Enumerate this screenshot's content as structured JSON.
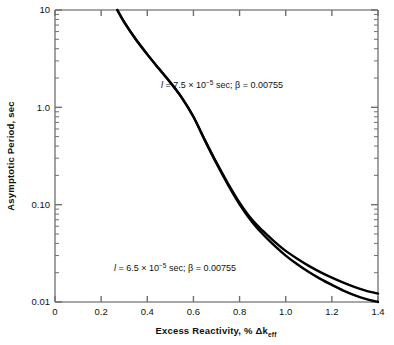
{
  "chart_data": {
    "type": "line",
    "title": "",
    "xlabel": "Excess Reactivity, % Δkeff",
    "ylabel": "Asymptotic Period, sec",
    "xscale": "linear",
    "yscale": "log",
    "xlim": [
      0,
      1.4
    ],
    "ylim": [
      0.01,
      10
    ],
    "grid": false,
    "legend_position": "inline-annotations",
    "xticks": [
      "0",
      "0.2",
      "0.4",
      "0.6",
      "0.8",
      "1.0",
      "1.2",
      "1.4"
    ],
    "xtick_values": [
      0,
      0.2,
      0.4,
      0.6,
      0.8,
      1.0,
      1.2,
      1.4
    ],
    "yticks": [
      "0.01",
      "0.10",
      "1.0",
      "10"
    ],
    "ytick_values": [
      0.01,
      0.1,
      1.0,
      10
    ],
    "series": [
      {
        "name": "l = 7.5 × 10⁻⁵ sec; β = 0.00755",
        "annotation": "l = 7.5 × 10⁻⁵ sec; β = 0.00755",
        "x": [
          0.27,
          0.3,
          0.35,
          0.4,
          0.45,
          0.5,
          0.55,
          0.6,
          0.65,
          0.7,
          0.75,
          0.8,
          0.85,
          0.9,
          0.95,
          1.0,
          1.05,
          1.1,
          1.15,
          1.2,
          1.25,
          1.3,
          1.35,
          1.4
        ],
        "y": [
          10.0,
          7.5,
          5.0,
          3.5,
          2.5,
          1.8,
          1.25,
          0.8,
          0.46,
          0.27,
          0.165,
          0.105,
          0.072,
          0.054,
          0.042,
          0.0335,
          0.0278,
          0.0235,
          0.0203,
          0.0178,
          0.0158,
          0.0142,
          0.013,
          0.0122
        ]
      },
      {
        "name": "l = 6.5 × 10⁻⁵ sec; β = 0.00755",
        "annotation": "l = 6.5 × 10⁻⁵ sec; β = 0.00755",
        "x": [
          0.27,
          0.3,
          0.35,
          0.4,
          0.45,
          0.5,
          0.55,
          0.6,
          0.65,
          0.7,
          0.75,
          0.8,
          0.85,
          0.9,
          0.95,
          1.0,
          1.05,
          1.1,
          1.15,
          1.2,
          1.25,
          1.3,
          1.35,
          1.4
        ],
        "y": [
          10.0,
          7.5,
          5.0,
          3.5,
          2.5,
          1.8,
          1.25,
          0.8,
          0.455,
          0.265,
          0.16,
          0.101,
          0.0685,
          0.05,
          0.0382,
          0.03,
          0.0244,
          0.0203,
          0.0173,
          0.015,
          0.0131,
          0.0117,
          0.0107,
          0.01
        ]
      }
    ]
  },
  "axis": {
    "x_label_main": "Excess Reactivity, % Δk",
    "x_label_sub": "eff",
    "y_label": "Asymptotic Period, sec"
  },
  "annotations": {
    "upper": {
      "prefix": "l",
      "body": " = 7.5 × 10",
      "exponent": "−5",
      "tail": " sec; β = 0.00755"
    },
    "lower": {
      "prefix": "l",
      "body": " = 6.5 × 10",
      "exponent": "−5",
      "tail": " sec; β = 0.00755"
    }
  },
  "colors": {
    "curve": "#000000",
    "axis": "#6f6f6f",
    "text": "#111111",
    "background": "#ffffff"
  }
}
